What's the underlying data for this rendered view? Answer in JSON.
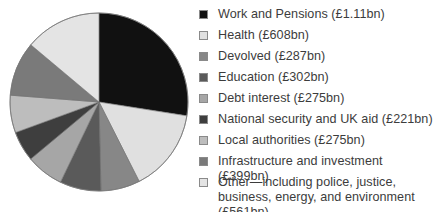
{
  "chart_data": {
    "type": "pie",
    "title": "",
    "unit": "£bn",
    "start_angle_deg": 0,
    "direction": "clockwise",
    "legend_position": "right",
    "categories": [
      "Work and Pensions",
      "Health",
      "Devolved",
      "Education",
      "Debt interest",
      "National security and UK aid",
      "Local authorities",
      "Infrastructure and investment",
      "Other—including police, justice, business, energy, and environment"
    ],
    "values": [
      1110,
      608,
      287,
      302,
      275,
      221,
      275,
      399,
      561
    ],
    "value_labels": [
      "£1.11bn",
      "£608bn",
      "£287bn",
      "£302bn",
      "£275bn",
      "£221bn",
      "£275bn",
      "£399bn",
      "£561bn"
    ],
    "colors": [
      "#111111",
      "#e0e0e0",
      "#878787",
      "#5a5a5a",
      "#a6a6a6",
      "#3e3e3e",
      "#bdbdbd",
      "#7a7a7a",
      "#e4e4e4"
    ]
  },
  "pie": {
    "cx": 99,
    "cy": 102,
    "r": 89,
    "stroke": "#6e6e6e"
  },
  "legend": {
    "items": [
      {
        "label": "Work and Pensions (£1.11bn)",
        "color": "#111111"
      },
      {
        "label": "Health (£608bn)",
        "color": "#e0e0e0"
      },
      {
        "label": "Devolved (£287bn)",
        "color": "#878787"
      },
      {
        "label": "Education (£302bn)",
        "color": "#5a5a5a"
      },
      {
        "label": "Debt interest (£275bn)",
        "color": "#a6a6a6"
      },
      {
        "label": "National security and UK aid (£221bn)",
        "color": "#3e3e3e"
      },
      {
        "label": "Local authorities (£275bn)",
        "color": "#bdbdbd"
      },
      {
        "label": "Infrastructure and investment (£399bn)",
        "color": "#7a7a7a"
      },
      {
        "label": "Other—including police, justice, business, energy, and environment (£561bn)",
        "color": "#e4e4e4"
      }
    ]
  }
}
